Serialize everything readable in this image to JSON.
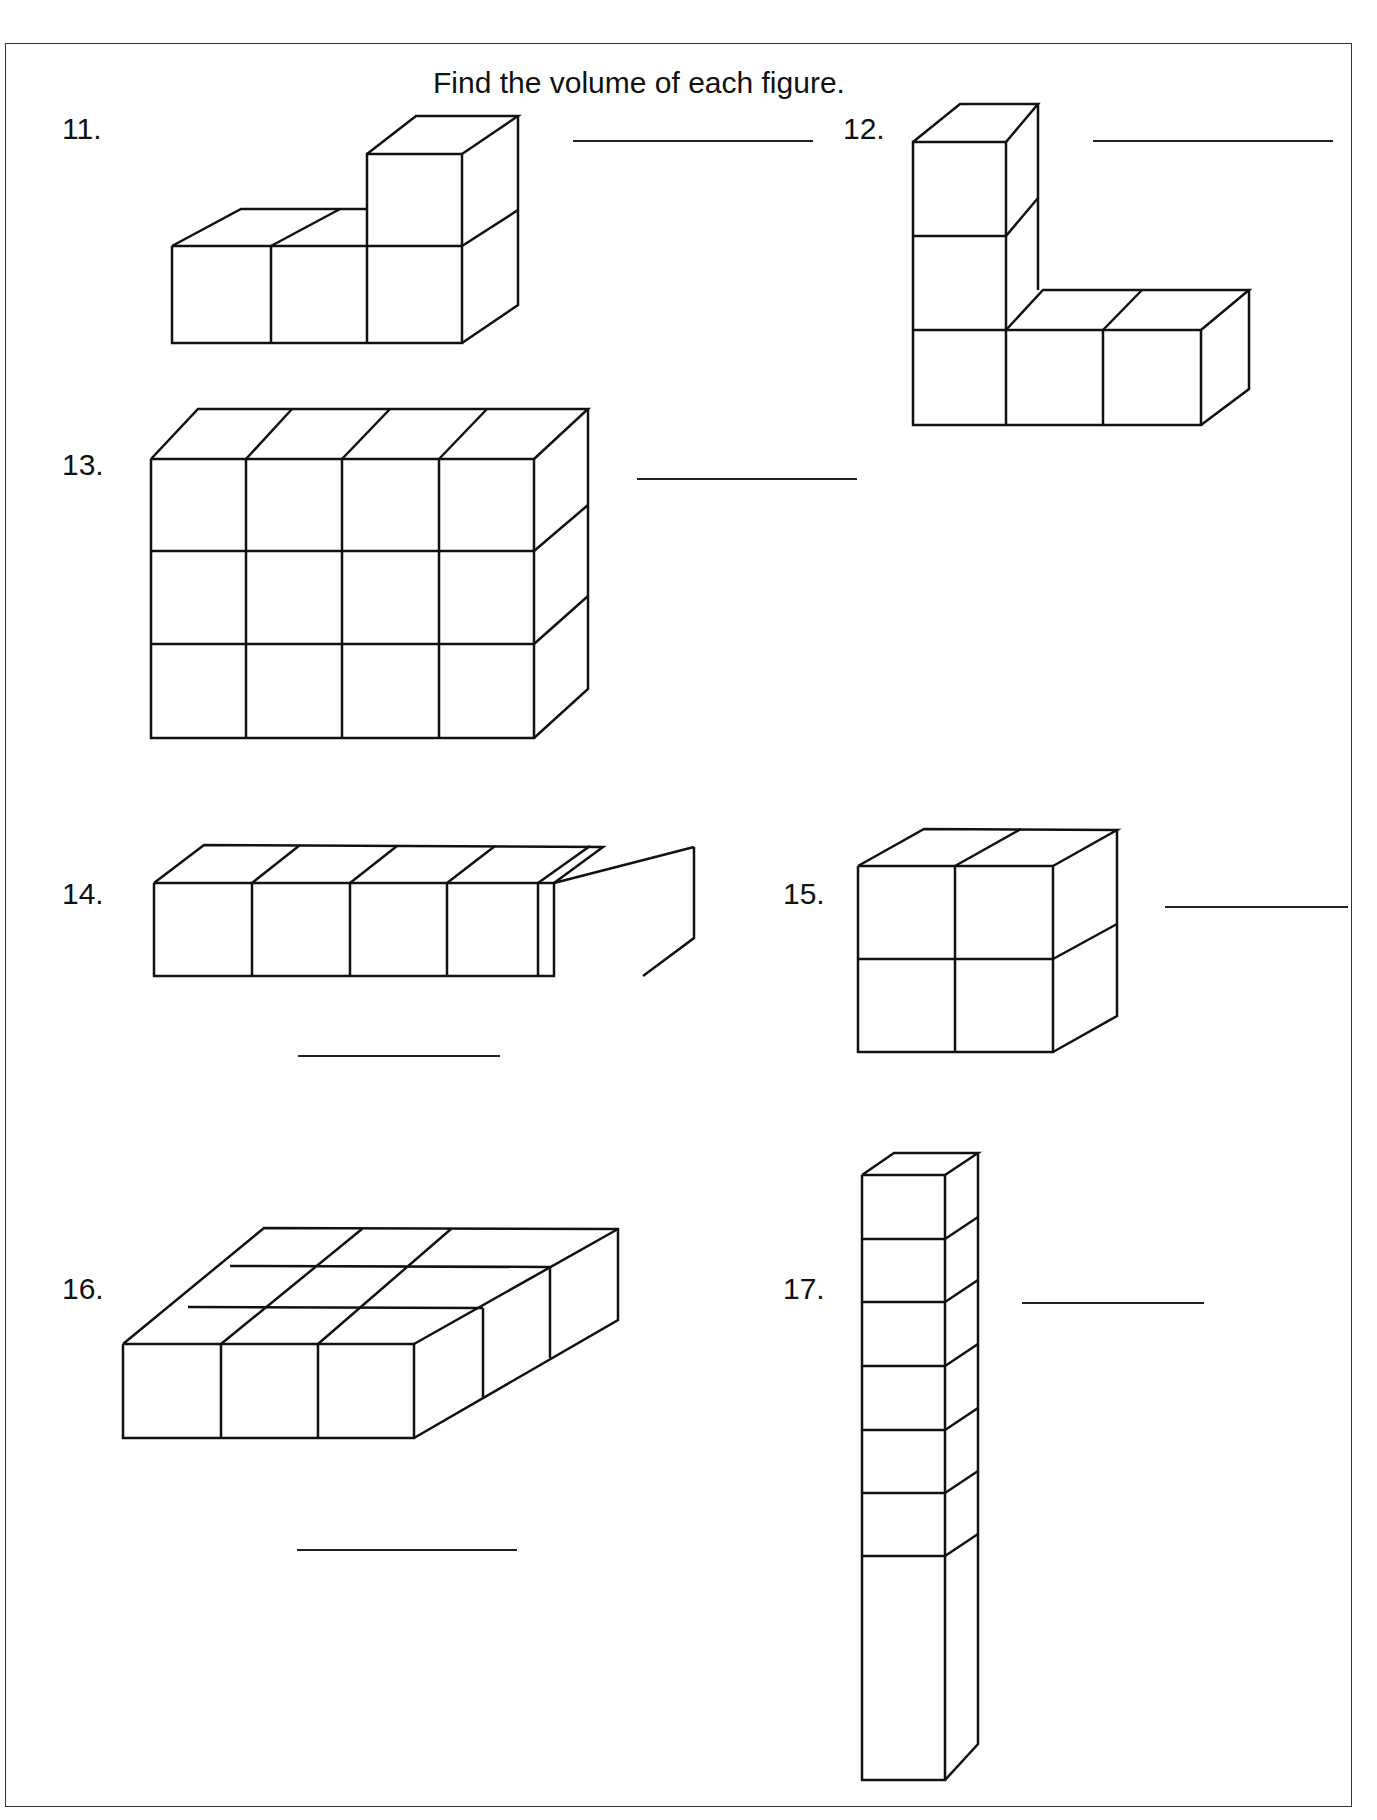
{
  "worksheet": {
    "title": "Find the volume of each figure.",
    "problems": [
      {
        "number": "11.",
        "answer": "",
        "cube_count": 4
      },
      {
        "number": "12.",
        "answer": "",
        "cube_count": 5
      },
      {
        "number": "13.",
        "answer": "",
        "cube_count": 12
      },
      {
        "number": "14.",
        "answer": "",
        "cube_count": 5
      },
      {
        "number": "15.",
        "answer": "",
        "cube_count": 8
      },
      {
        "number": "16.",
        "answer": "",
        "cube_count": 9
      },
      {
        "number": "17.",
        "answer": "",
        "cube_count": 7
      }
    ]
  }
}
